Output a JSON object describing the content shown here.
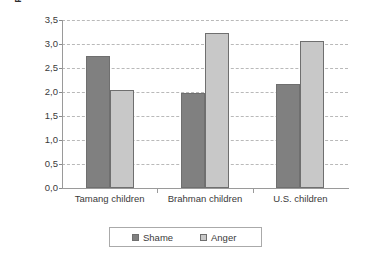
{
  "chart_data": {
    "type": "bar",
    "title": "",
    "subtitle": "",
    "xlabel": "",
    "ylabel": "Frequency of experience",
    "categories": [
      "Tamang children",
      "Brahman children",
      "U.S. children"
    ],
    "series": [
      {
        "name": "Shame",
        "values": [
          2.75,
          1.98,
          2.17
        ],
        "color": "#808080"
      },
      {
        "name": "Anger",
        "values": [
          2.05,
          3.23,
          3.07
        ],
        "color": "#c8c8c8"
      }
    ],
    "ylim": [
      0.0,
      3.5
    ],
    "ytick_values": [
      0.0,
      0.5,
      1.0,
      1.5,
      2.0,
      2.5,
      3.0,
      3.5
    ],
    "ytick_labels": [
      "0,0",
      "0,5",
      "1,0",
      "1,5",
      "2,0",
      "2,5",
      "3,0",
      "3,5"
    ],
    "grid": true,
    "grid_style": "dashed-horizontal",
    "grid_color": "#b9b9b9",
    "legend_position": "bottom",
    "bar_border_color": "#6f6f6f",
    "axis_color": "#9a9a9a",
    "background": "#ffffff"
  }
}
